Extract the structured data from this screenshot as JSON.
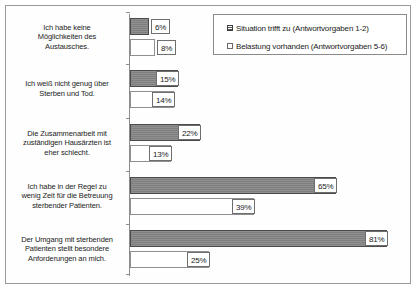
{
  "legend": {
    "position": "top-right",
    "entries": [
      {
        "label": "Situation trifft zu (Antwortvorgaben 1-2)",
        "swatch": "filled-gray-square"
      },
      {
        "label": "Belastung vorhanden (Antwortvorgaben 5-6)",
        "swatch": "empty-white-square"
      }
    ]
  },
  "chart_data": {
    "type": "bar",
    "orientation": "horizontal",
    "title": "",
    "xlabel": "",
    "ylabel": "",
    "xlim": [
      0,
      100
    ],
    "grid": false,
    "value_suffix": "%",
    "categories": [
      "Ich habe keine Möglichkeiten des Austausches.",
      "Ich weiß nicht genug über Sterben und Tod.",
      "Die Zusammenarbeit mit zuständigen Hausärzten ist eher schlecht.",
      "Ich habe in der Regel zu wenig Zeit für die Betreuung sterbender Patienten.",
      "Der Umgang mit sterbenden Patienten stellt besondere Anforderungen an mich."
    ],
    "category_lines": [
      [
        "Ich habe keine",
        "Möglichkeiten des",
        "Austausches."
      ],
      [
        "Ich weiß nicht genug über",
        "Sterben und Tod."
      ],
      [
        "Die Zusammenarbeit mit",
        "zuständigen Hausärzten ist",
        "eher schlecht."
      ],
      [
        "Ich habe in der Regel zu",
        "wenig Zeit für die Betreuung",
        "sterbender Patienten."
      ],
      [
        "Der Umgang mit sterbenden",
        "Patienten stellt besondere",
        "Anforderungen an mich."
      ]
    ],
    "series": [
      {
        "name": "Situation trifft zu (Antwortvorgaben 1-2)",
        "color": "#838383",
        "values": [
          6,
          15,
          22,
          65,
          81
        ],
        "labels": [
          "6%",
          "15%",
          "22%",
          "65%",
          "81%"
        ]
      },
      {
        "name": "Belastung vorhanden (Antwortvorgaben 5-6)",
        "color": "#ffffff",
        "values": [
          8,
          14,
          13,
          39,
          25
        ],
        "labels": [
          "8%",
          "14%",
          "13%",
          "39%",
          "25%"
        ]
      }
    ]
  }
}
